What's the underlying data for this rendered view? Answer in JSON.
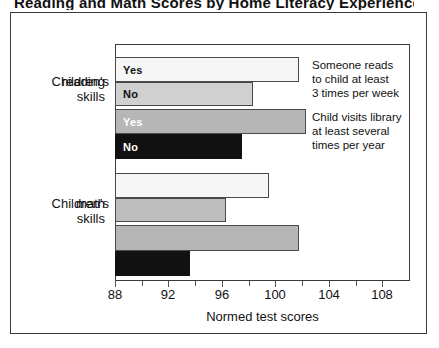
{
  "caption": {
    "text": "Reading and Math Scores by Home Literacy Experiences"
  },
  "chart_data": {
    "type": "bar",
    "orientation": "horizontal",
    "title": "",
    "xlabel": "Normed test scores",
    "ylabel": "",
    "xlim": [
      88,
      110
    ],
    "xticks": [
      88,
      90,
      92,
      94,
      96,
      98,
      100,
      102,
      104,
      106,
      108
    ],
    "xtick_labels": [
      "88",
      "",
      "92",
      "",
      "96",
      "",
      "100",
      "",
      "104",
      "",
      "108"
    ],
    "grid": false,
    "legend_position": "right-annotations",
    "groups": [
      {
        "label": "Children's\nreading\nskills",
        "label_lines": [
          "Children's",
          "reading",
          "skills"
        ],
        "bars": [
          {
            "label": "Yes",
            "value": 101.8,
            "fill": "white",
            "annotation_group": 0
          },
          {
            "label": "No",
            "value": 98.3,
            "fill": "light",
            "annotation_group": 0
          },
          {
            "label": "Yes",
            "value": 102.3,
            "fill": "gray",
            "annotation_group": 1
          },
          {
            "label": "No",
            "value": 97.5,
            "fill": "black",
            "annotation_group": 1
          }
        ]
      },
      {
        "label": "Children's\nmath\nskills",
        "label_lines": [
          "Children's",
          "math",
          "skills"
        ],
        "bars": [
          {
            "label": "",
            "value": 99.5,
            "fill": "white",
            "annotation_group": 0
          },
          {
            "label": "",
            "value": 96.3,
            "fill": "light",
            "annotation_group": 0
          },
          {
            "label": "",
            "value": 101.8,
            "fill": "gray",
            "annotation_group": 1
          },
          {
            "label": "",
            "value": 93.6,
            "fill": "black",
            "annotation_group": 1
          }
        ]
      }
    ],
    "annotations": [
      {
        "lines": [
          "Someone reads",
          "to child at least",
          "3 times per week"
        ]
      },
      {
        "lines": [
          "Child visits library",
          "at least several",
          "times per year"
        ]
      }
    ],
    "colors": {
      "white": "#f6f6f6",
      "light": "#efefef",
      "gray": "#b6b6b6",
      "black": "#111111",
      "outline": "#4a4a4a",
      "frame": "#3a3a3a",
      "text": "#111111"
    }
  },
  "axis": {
    "title": "Normed test scores"
  },
  "group_labels": {
    "reading": [
      "Children's",
      "reading",
      "skills"
    ],
    "math": [
      "Children's",
      "math",
      "skills"
    ]
  },
  "annotation_text": {
    "a0_l0": "Someone reads",
    "a0_l1": "to child at least",
    "a0_l2": "3 times per week",
    "a1_l0": "Child visits library",
    "a1_l1": "at least several",
    "a1_l2": "times per year"
  },
  "tick_text": {
    "t88": "88",
    "t92": "92",
    "t96": "96",
    "t100": "100",
    "t104": "104",
    "t108": "108"
  },
  "bar_text": {
    "r0": "Yes",
    "r1": "No",
    "r2": "Yes",
    "r3": "No"
  }
}
